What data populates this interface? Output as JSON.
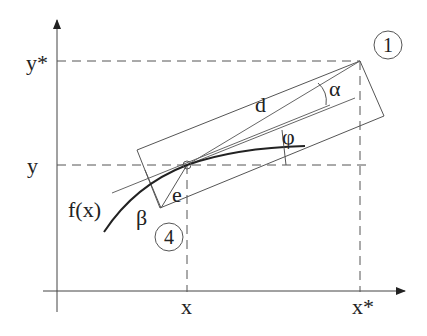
{
  "axes": {
    "x_label": "x",
    "x_star_label": "x*",
    "y_label": "y",
    "y_star_label": "y*"
  },
  "curve": {
    "label": "f(x)"
  },
  "annotations": {
    "distance": "d",
    "angle_alpha": "α",
    "angle_phi": "φ",
    "angle_beta": "β",
    "error": "e"
  },
  "markers": {
    "point_1": "1",
    "point_4": "4"
  },
  "colors": {
    "stroke": "#555555",
    "curve": "#222222",
    "text": "#222222",
    "background": "#ffffff"
  }
}
